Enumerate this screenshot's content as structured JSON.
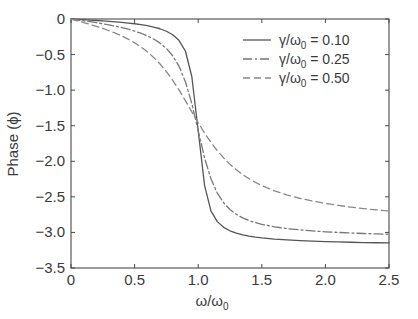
{
  "chart_data": {
    "type": "line",
    "title": "",
    "subtitle": "",
    "xlabel": "ω/ω₀",
    "ylabel": "Phase (ϕ)",
    "xlim": [
      0,
      2.5
    ],
    "ylim": [
      -3.5,
      0
    ],
    "grid": false,
    "legend_position": "top-right",
    "x_ticks": [
      "0",
      "0.5",
      "1.0",
      "1.5",
      "2.0",
      "2.5"
    ],
    "x_tick_values": [
      0,
      0.5,
      1.0,
      1.5,
      2.0,
      2.5
    ],
    "y_ticks": [
      "0",
      "−0.5",
      "−1.0",
      "−1.5",
      "−2.0",
      "−2.5",
      "−3.0",
      "−3.5"
    ],
    "y_tick_values": [
      0,
      -0.5,
      -1.0,
      -1.5,
      -2.0,
      -2.5,
      -3.0,
      -3.5
    ],
    "x": [
      0,
      0.05,
      0.1,
      0.15,
      0.2,
      0.25,
      0.3,
      0.35,
      0.4,
      0.45,
      0.5,
      0.55,
      0.6,
      0.65,
      0.7,
      0.75,
      0.8,
      0.85,
      0.9,
      0.95,
      1.0,
      1.05,
      1.1,
      1.15,
      1.2,
      1.25,
      1.3,
      1.35,
      1.4,
      1.45,
      1.5,
      1.6,
      1.7,
      1.8,
      1.9,
      2.0,
      2.1,
      2.2,
      2.3,
      2.4,
      2.5
    ],
    "series": [
      {
        "name": "γ/ω₀ =  0.10",
        "gamma_over_omega0": 0.1,
        "style": "solid",
        "color": "#555555",
        "values": [
          0,
          -0.005,
          -0.01,
          -0.015,
          -0.021,
          -0.027,
          -0.033,
          -0.04,
          -0.048,
          -0.057,
          -0.067,
          -0.079,
          -0.094,
          -0.113,
          -0.137,
          -0.172,
          -0.222,
          -0.303,
          -0.453,
          -0.812,
          -1.571,
          -2.339,
          -2.697,
          -2.848,
          -2.928,
          -2.977,
          -3.01,
          -3.034,
          -3.052,
          -3.066,
          -3.077,
          -3.094,
          -3.106,
          -3.116,
          -3.123,
          -3.129,
          -3.134,
          -3.138,
          -3.142,
          -3.145,
          -3.148
        ]
      },
      {
        "name": "γ/ω₀ =  0.25",
        "gamma_over_omega0": 0.25,
        "style": "dash-dot",
        "color": "#777777",
        "values": [
          0,
          -0.013,
          -0.025,
          -0.038,
          -0.052,
          -0.067,
          -0.083,
          -0.101,
          -0.121,
          -0.144,
          -0.17,
          -0.2,
          -0.237,
          -0.282,
          -0.339,
          -0.414,
          -0.518,
          -0.666,
          -0.885,
          -1.19,
          -1.571,
          -1.951,
          -2.244,
          -2.446,
          -2.583,
          -2.678,
          -2.745,
          -2.795,
          -2.833,
          -2.862,
          -2.886,
          -2.921,
          -2.946,
          -2.964,
          -2.979,
          -2.991,
          -3.0,
          -3.008,
          -3.015,
          -3.021,
          -3.026
        ]
      },
      {
        "name": "γ/ω₀ =  0.50",
        "gamma_over_omega0": 0.5,
        "style": "dashed",
        "color": "#888888",
        "values": [
          0,
          -0.025,
          -0.05,
          -0.076,
          -0.104,
          -0.133,
          -0.165,
          -0.2,
          -0.24,
          -0.284,
          -0.335,
          -0.393,
          -0.461,
          -0.54,
          -0.632,
          -0.739,
          -0.862,
          -1.0,
          -1.15,
          -1.305,
          -1.458,
          -1.602,
          -1.733,
          -1.85,
          -1.953,
          -2.043,
          -2.12,
          -2.188,
          -2.246,
          -2.297,
          -2.342,
          -2.415,
          -2.474,
          -2.521,
          -2.56,
          -2.593,
          -2.62,
          -2.644,
          -2.665,
          -2.683,
          -2.699
        ]
      }
    ]
  },
  "axes": {
    "y_label_text": "Phase",
    "y_label_paren_open": "(",
    "y_label_symbol": "ϕ",
    "y_label_paren_close": ")",
    "x_label_main": "ω/ω",
    "x_label_sub": "0"
  },
  "legend": {
    "entries": [
      {
        "symbol": "γ/ω",
        "subscript": "0",
        "equals": "=",
        "value": "0.10",
        "style": "solid"
      },
      {
        "symbol": "γ/ω",
        "subscript": "0",
        "equals": "=",
        "value": "0.25",
        "style": "dash-dot"
      },
      {
        "symbol": "γ/ω",
        "subscript": "0",
        "equals": "=",
        "value": "0.50",
        "style": "dashed"
      }
    ]
  },
  "colors": {
    "background": "#ffffff",
    "axis": "#4a4a4a",
    "text": "#3a3a3a",
    "curve_solid": "#555555",
    "curve_dashdot": "#777777",
    "curve_dashed": "#888888"
  }
}
